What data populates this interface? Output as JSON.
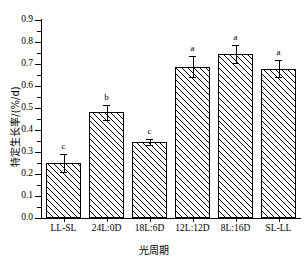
{
  "chart_data": {
    "type": "bar",
    "title": "",
    "xlabel": "光周期",
    "ylabel": "特定生长率/(%/d)",
    "categories": [
      "LL-SL",
      "24L:0D",
      "18L:6D",
      "12L:12D",
      "8L:16D",
      "SL-LL"
    ],
    "values": [
      0.25,
      0.48,
      0.345,
      0.688,
      0.745,
      0.678
    ],
    "errors": [
      0.04,
      0.035,
      0.012,
      0.048,
      0.04,
      0.038
    ],
    "annotations": [
      "c",
      "b",
      "c",
      "a",
      "a",
      "a"
    ],
    "ylim": [
      0.0,
      0.9
    ],
    "yticks": [
      0.0,
      0.1,
      0.2,
      0.3,
      0.4,
      0.5,
      0.6,
      0.7,
      0.8,
      0.9
    ],
    "ytick_labels": [
      "0.0",
      "0.1",
      "0.2",
      "0.3",
      "0.4",
      "0.5",
      "0.6",
      "0.7",
      "0.8",
      "0.9"
    ],
    "grid": false,
    "legend": false,
    "bar_fill": "hatched-diagonal",
    "bar_edge_color": "#000000",
    "background": "#ffffff"
  }
}
